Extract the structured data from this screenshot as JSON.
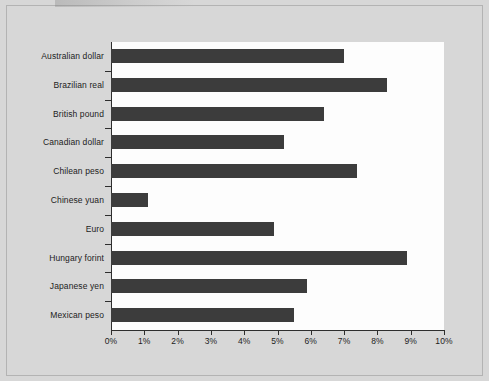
{
  "chart_data": {
    "type": "bar",
    "orientation": "horizontal",
    "title": "",
    "xlabel": "",
    "ylabel": "",
    "xlim": [
      0,
      10
    ],
    "xtick_labels": [
      "0%",
      "1%",
      "2%",
      "3%",
      "4%",
      "5%",
      "6%",
      "7%",
      "8%",
      "9%",
      "10%"
    ],
    "xtick_values": [
      0,
      1,
      2,
      3,
      4,
      5,
      6,
      7,
      8,
      9,
      10
    ],
    "grid": false,
    "legend": false,
    "categories": [
      "Australian dollar",
      "Brazilian real",
      "British pound",
      "Canadian dollar",
      "Chilean peso",
      "Chinese yuan",
      "Euro",
      "Hungary forint",
      "Japanese yen",
      "Mexican peso"
    ],
    "values": [
      7.0,
      8.3,
      6.4,
      5.2,
      7.4,
      1.1,
      4.9,
      8.9,
      5.9,
      5.5
    ],
    "value_unit": "%",
    "bar_color": "#3c3c3c",
    "plot_background": "#fdfdfd",
    "page_background": "#d7d7d7",
    "axis_color": "#2e2e2e"
  }
}
